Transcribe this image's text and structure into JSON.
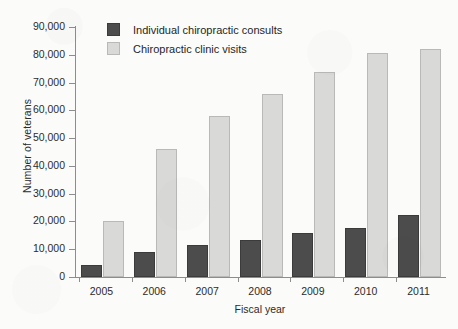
{
  "chart_data": {
    "type": "bar",
    "title": "",
    "xlabel": "Fiscal year",
    "ylabel": "Number of veterans",
    "categories": [
      "2005",
      "2006",
      "2007",
      "2008",
      "2009",
      "2010",
      "2011"
    ],
    "series": [
      {
        "name": "Individual chiropractic consults",
        "color": "#4c4c4c",
        "values": [
          4200,
          9000,
          11500,
          13200,
          16000,
          17500,
          22200
        ]
      },
      {
        "name": "Chiropractic clinic visits",
        "color": "#d9d9d7",
        "values": [
          20000,
          46000,
          58000,
          66000,
          73800,
          80800,
          82000
        ]
      }
    ],
    "ylim": [
      0,
      90000
    ],
    "yticks": [
      0,
      10000,
      20000,
      30000,
      40000,
      50000,
      60000,
      70000,
      80000,
      90000
    ],
    "ytick_labels": [
      "0",
      "10,000",
      "20,000",
      "30,000",
      "40,000",
      "50,000",
      "60,000",
      "70,000",
      "80,000",
      "90,000"
    ],
    "grid": false,
    "legend_position": "top-left"
  }
}
